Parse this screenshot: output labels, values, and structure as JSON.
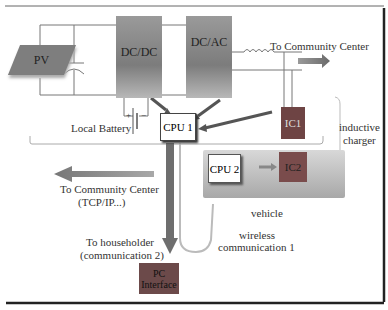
{
  "diagram": {
    "blocks": {
      "pv": "PV",
      "dcdc": "DC/DC",
      "dcac": "DC/AC",
      "cpu1": "CPU 1",
      "ic1": "IC1",
      "cpu2": "CPU 2",
      "ic2": "IC2",
      "pc_line1": "PC",
      "pc_line2": "Interface"
    },
    "labels": {
      "to_community_top": "To Community Center",
      "local_battery": "Local Battery",
      "battery_plus": "+",
      "battery_minus": "−",
      "inductive_line1": "inductive",
      "inductive_line2": "charger",
      "to_community_left_line1": "To Community Center",
      "to_community_left_line2": "(TCP/IP...)",
      "vehicle": "vehicle",
      "wireless_line1": "wireless",
      "wireless_line2": "communication 1",
      "householder_line1": "To householder",
      "householder_line2": "(communication 2)"
    },
    "colors": {
      "converter_block": "#8a8a8a",
      "ic_block": "#7a4a4a",
      "pc_block": "#6e4a4a",
      "arrow": "#6a6a6a",
      "vehicle_panel": "#bfbfbf"
    }
  }
}
